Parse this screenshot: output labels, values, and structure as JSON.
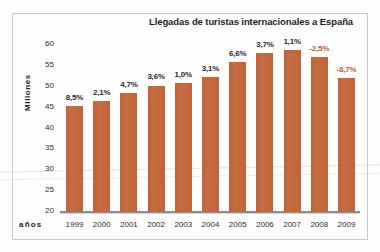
{
  "chart_data": {
    "type": "bar",
    "title": "Llegadas de turistas internacionales a España",
    "xlabel": "años",
    "ylabel": "Millones",
    "categories": [
      "1999",
      "2000",
      "2001",
      "2002",
      "2003",
      "2004",
      "2005",
      "2006",
      "2007",
      "2008",
      "2009"
    ],
    "values": [
      45.5,
      46.5,
      48.6,
      50.3,
      50.8,
      52.4,
      55.9,
      58.0,
      58.7,
      57.2,
      52.2
    ],
    "point_labels": [
      "8,5%",
      "2,1%",
      "4,7%",
      "3,6%",
      "1,0%",
      "3,1%",
      "6,6%",
      "3,7%",
      "1,1%",
      "-2,5%",
      "-8,7%"
    ],
    "point_label_negative": [
      false,
      false,
      false,
      false,
      false,
      false,
      false,
      false,
      false,
      true,
      true
    ],
    "ylim": [
      20,
      60
    ],
    "yticks": [
      "60",
      "55",
      "50",
      "45",
      "40",
      "35",
      "30",
      "25",
      "20"
    ],
    "grid": false,
    "legend": "none",
    "bar_color": "#c4693d",
    "negative_label_color": "#c0603a"
  }
}
